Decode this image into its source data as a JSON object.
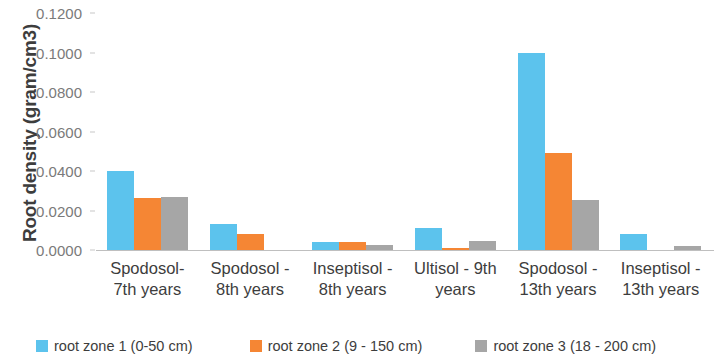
{
  "chart_data": {
    "type": "bar",
    "title": "",
    "xlabel": "",
    "ylabel": "Root density (gram/cm3)",
    "ylim": [
      0,
      0.12
    ],
    "ytick_labels": [
      "0.1200",
      "0.1000",
      "0.0800",
      "0.0600",
      "0.0400",
      "0.0200",
      "0.0000"
    ],
    "ytick_values": [
      0.12,
      0.1,
      0.08,
      0.06,
      0.04,
      0.02,
      0
    ],
    "grid": false,
    "legend_position": "bottom",
    "categories": [
      "Spodosol-\n7th years",
      "Spodosol -\n8th years",
      "Inseptisol -\n8th years",
      "Ultisol - 9th\nyears",
      "Spodosol -\n13th years",
      "Inseptisol -\n13th years"
    ],
    "categories_flat": [
      "Spodosol- 7th years",
      "Spodosol - 8th years",
      "Inseptisol - 8th years",
      "Ultisol - 9th years",
      "Spodosol - 13th years",
      "Inseptisol - 13th years"
    ],
    "series": [
      {
        "name": "root zone 1 (0-50 cm)",
        "color": "#5cc3ed",
        "values": [
          0.04,
          0.013,
          0.004,
          0.011,
          0.1,
          0.008
        ]
      },
      {
        "name": "root zone 2 (9 - 150 cm)",
        "color": "#f58634",
        "values": [
          0.0262,
          0.0082,
          0.004,
          0.0008,
          0.049,
          0.0
        ]
      },
      {
        "name": "root zone 3 (18 - 200 cm)",
        "color": "#a6a6a6",
        "values": [
          0.027,
          0.0,
          0.0025,
          0.0045,
          0.0255,
          0.002
        ]
      }
    ]
  },
  "legend": {
    "items": [
      {
        "label": "root zone 1 (0-50 cm)"
      },
      {
        "label": "root zone 2 (9 - 150 cm)"
      },
      {
        "label": "root zone 3 (18 - 200 cm)"
      }
    ]
  },
  "axis": {
    "y_title": "Root density (gram/cm3)"
  }
}
